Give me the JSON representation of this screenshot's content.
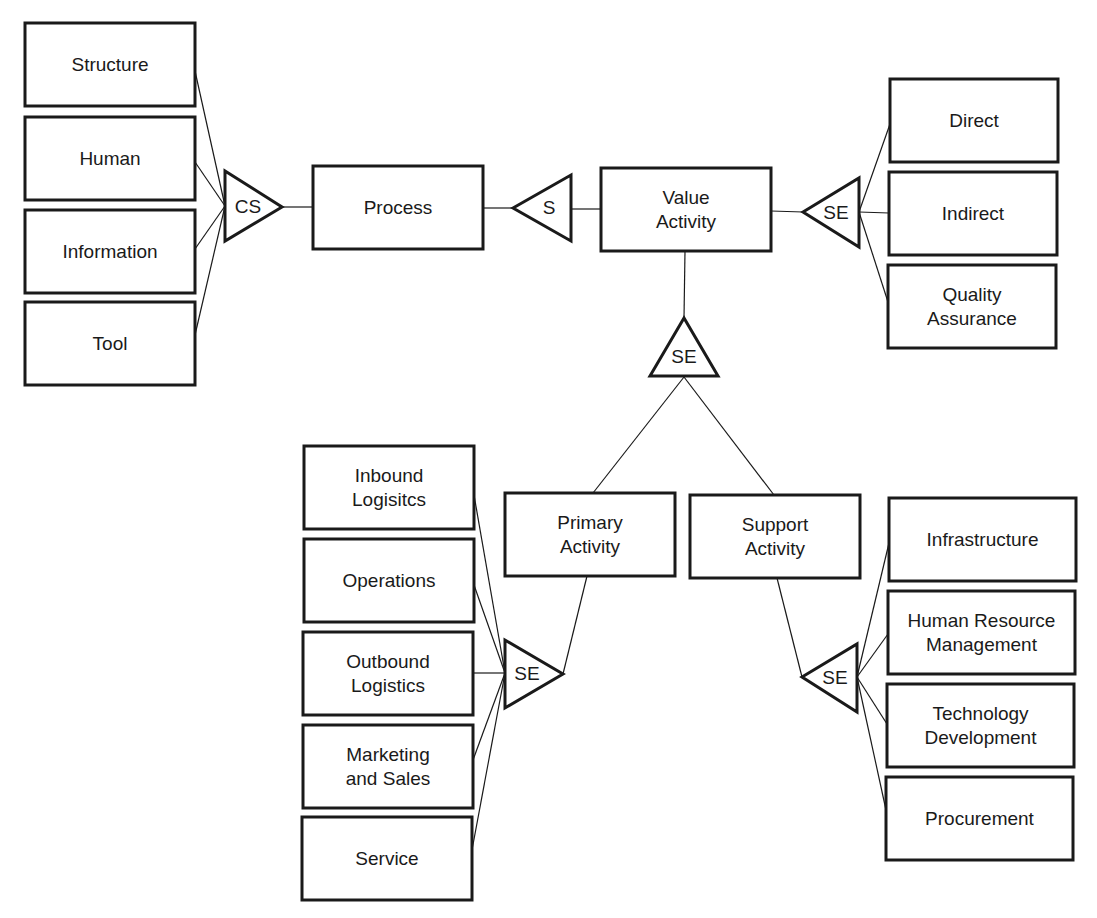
{
  "diagram": {
    "type": "value-activity-decomposition",
    "colors": {
      "stroke": "#1a1a1a",
      "background": "#ffffff"
    },
    "nodes": [
      {
        "id": "structure",
        "lines": [
          "Structure"
        ],
        "x": 25,
        "y": 23,
        "w": 170,
        "h": 83
      },
      {
        "id": "human",
        "lines": [
          "Human"
        ],
        "x": 25,
        "y": 117,
        "w": 170,
        "h": 83
      },
      {
        "id": "information",
        "lines": [
          "Information"
        ],
        "x": 25,
        "y": 210,
        "w": 170,
        "h": 83
      },
      {
        "id": "tool",
        "lines": [
          "Tool"
        ],
        "x": 25,
        "y": 302,
        "w": 170,
        "h": 83
      },
      {
        "id": "process",
        "lines": [
          "Process"
        ],
        "x": 313,
        "y": 166,
        "w": 170,
        "h": 83
      },
      {
        "id": "value-activity",
        "lines": [
          "Value",
          "Activity"
        ],
        "x": 601,
        "y": 168,
        "w": 170,
        "h": 83
      },
      {
        "id": "direct",
        "lines": [
          "Direct"
        ],
        "x": 890,
        "y": 79,
        "w": 168,
        "h": 83
      },
      {
        "id": "indirect",
        "lines": [
          "Indirect"
        ],
        "x": 889,
        "y": 172,
        "w": 168,
        "h": 83
      },
      {
        "id": "quality-assurance",
        "lines": [
          "Quality",
          "Assurance"
        ],
        "x": 888,
        "y": 265,
        "w": 168,
        "h": 83
      },
      {
        "id": "primary-activity",
        "lines": [
          "Primary",
          "Activity"
        ],
        "x": 505,
        "y": 493,
        "w": 170,
        "h": 83
      },
      {
        "id": "support-activity",
        "lines": [
          "Support",
          "Activity"
        ],
        "x": 690,
        "y": 495,
        "w": 170,
        "h": 83
      },
      {
        "id": "inbound-logistics",
        "lines": [
          "Inbound",
          "Logisitcs"
        ],
        "x": 304,
        "y": 446,
        "w": 170,
        "h": 83
      },
      {
        "id": "operations",
        "lines": [
          "Operations"
        ],
        "x": 304,
        "y": 539,
        "w": 170,
        "h": 83
      },
      {
        "id": "outbound-logistics",
        "lines": [
          "Outbound",
          "Logistics"
        ],
        "x": 303,
        "y": 632,
        "w": 170,
        "h": 83
      },
      {
        "id": "marketing-and-sales",
        "lines": [
          "Marketing",
          "and Sales"
        ],
        "x": 303,
        "y": 725,
        "w": 170,
        "h": 83
      },
      {
        "id": "service",
        "lines": [
          "Service"
        ],
        "x": 302,
        "y": 817,
        "w": 170,
        "h": 83
      },
      {
        "id": "infrastructure",
        "lines": [
          "Infrastructure"
        ],
        "x": 889,
        "y": 498,
        "w": 187,
        "h": 83
      },
      {
        "id": "human-resource-management",
        "lines": [
          "Human Resource",
          "Management"
        ],
        "x": 888,
        "y": 591,
        "w": 187,
        "h": 83
      },
      {
        "id": "technology-development",
        "lines": [
          "Technology",
          "Development"
        ],
        "x": 887,
        "y": 684,
        "w": 187,
        "h": 83
      },
      {
        "id": "procurement",
        "lines": [
          "Procurement"
        ],
        "x": 886,
        "y": 777,
        "w": 187,
        "h": 83
      }
    ],
    "connectors": [
      {
        "id": "cs-left",
        "label": "CS",
        "points": "225,171 225,241 282,207",
        "tx": 248,
        "ty": 207
      },
      {
        "id": "s-top",
        "label": "S",
        "points": "513,208 571,175 571,241",
        "tx": 549,
        "ty": 208
      },
      {
        "id": "se-right",
        "label": "SE",
        "points": "803,212 859,178 859,247",
        "tx": 836,
        "ty": 213
      },
      {
        "id": "se-center",
        "label": "SE",
        "points": "684,318 650,376 718,376",
        "tx": 684,
        "ty": 357
      },
      {
        "id": "se-primary",
        "label": "SE",
        "points": "505,640 505,708 563,674",
        "tx": 527,
        "ty": 674
      },
      {
        "id": "se-support",
        "label": "SE",
        "points": "802,677 857,644 857,712",
        "tx": 835,
        "ty": 678
      }
    ],
    "edges": [
      {
        "from": "structure",
        "x1": 195,
        "y1": 71,
        "x2": 225,
        "y2": 206
      },
      {
        "from": "human",
        "x1": 195,
        "y1": 162,
        "x2": 225,
        "y2": 206
      },
      {
        "from": "information",
        "x1": 195,
        "y1": 249,
        "x2": 225,
        "y2": 206
      },
      {
        "from": "tool",
        "x1": 195,
        "y1": 335,
        "x2": 225,
        "y2": 206
      },
      {
        "from": "cs-left",
        "x1": 282,
        "y1": 207,
        "x2": 313,
        "y2": 207
      },
      {
        "from": "process",
        "x1": 483,
        "y1": 208,
        "x2": 513,
        "y2": 208
      },
      {
        "from": "s-top",
        "x1": 571,
        "y1": 209,
        "x2": 601,
        "y2": 209
      },
      {
        "from": "value-activity",
        "x1": 771,
        "y1": 211,
        "x2": 803,
        "y2": 212
      },
      {
        "from": "se-right",
        "x1": 859,
        "y1": 212,
        "x2": 890,
        "y2": 124
      },
      {
        "from": "se-right",
        "x1": 859,
        "y1": 212,
        "x2": 889,
        "y2": 213
      },
      {
        "from": "se-right",
        "x1": 859,
        "y1": 212,
        "x2": 888,
        "y2": 302
      },
      {
        "from": "value-activity",
        "x1": 685,
        "y1": 251,
        "x2": 684,
        "y2": 318
      },
      {
        "from": "se-center",
        "x1": 684,
        "y1": 377,
        "x2": 593,
        "y2": 493
      },
      {
        "from": "se-center",
        "x1": 684,
        "y1": 377,
        "x2": 774,
        "y2": 495
      },
      {
        "from": "primary-activity",
        "x1": 587,
        "y1": 576,
        "x2": 563,
        "y2": 674
      },
      {
        "from": "support-activity",
        "x1": 777,
        "y1": 578,
        "x2": 802,
        "y2": 677
      },
      {
        "from": "inbound-logistics",
        "x1": 474,
        "y1": 495,
        "x2": 505,
        "y2": 673
      },
      {
        "from": "operations",
        "x1": 474,
        "y1": 585,
        "x2": 505,
        "y2": 673
      },
      {
        "from": "outbound-logistics",
        "x1": 473,
        "y1": 673,
        "x2": 505,
        "y2": 673
      },
      {
        "from": "marketing-and-sales",
        "x1": 473,
        "y1": 760,
        "x2": 505,
        "y2": 673
      },
      {
        "from": "service",
        "x1": 472,
        "y1": 850,
        "x2": 505,
        "y2": 673
      },
      {
        "from": "se-support",
        "x1": 857,
        "y1": 677,
        "x2": 889,
        "y2": 543
      },
      {
        "from": "se-support",
        "x1": 857,
        "y1": 677,
        "x2": 888,
        "y2": 634
      },
      {
        "from": "se-support",
        "x1": 857,
        "y1": 677,
        "x2": 887,
        "y2": 724
      },
      {
        "from": "se-support",
        "x1": 857,
        "y1": 677,
        "x2": 886,
        "y2": 810
      }
    ]
  }
}
